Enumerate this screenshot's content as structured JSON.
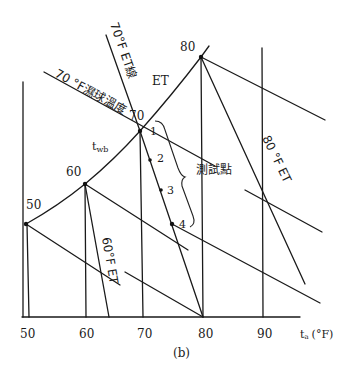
{
  "diagram": {
    "caption": "(b)",
    "x_axis": {
      "label": "t",
      "label_subscript": "a",
      "unit": "(°F)",
      "ticks": [
        "50",
        "60",
        "70",
        "80",
        "90"
      ]
    },
    "curve": {
      "name": "twb",
      "label": "t",
      "label_subscript": "wb",
      "points": [
        "50",
        "60",
        "70",
        "80"
      ]
    },
    "line_labels": {
      "et_70_line": "70°F ET線",
      "wet_bulb_70": "70 °F濕球溫度",
      "et_region": "ET",
      "et_80": "80 °F ET",
      "et_60": "60°F ET"
    },
    "test_points": {
      "label": "測試點",
      "points": [
        "1",
        "2",
        "3",
        "4"
      ]
    },
    "colors": {
      "line": "#1a1a1a",
      "background": "#ffffff"
    }
  }
}
